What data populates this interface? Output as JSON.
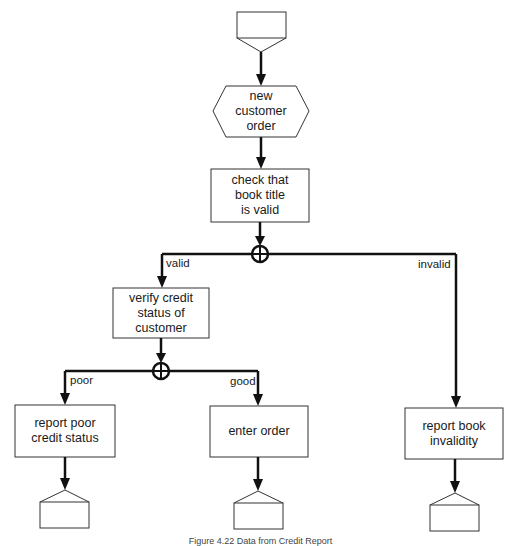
{
  "figure": {
    "type": "flowchart",
    "caption": "Figure 4.22  Data from Credit Report"
  },
  "nodes": {
    "start": {
      "shape": "start-terminal",
      "label": ""
    },
    "new_order": {
      "shape": "hexagon",
      "label": "new\ncustomer\norder"
    },
    "check_title": {
      "shape": "process",
      "label": "check that\nbook title\nis valid"
    },
    "junction1": {
      "shape": "xor-junction",
      "label": ""
    },
    "verify_credit": {
      "shape": "process",
      "label": "verify credit\nstatus of customer"
    },
    "junction2": {
      "shape": "xor-junction",
      "label": ""
    },
    "report_poor": {
      "shape": "process",
      "label": "report poor\ncredit status"
    },
    "enter_order": {
      "shape": "process",
      "label": "enter order"
    },
    "report_invalid": {
      "shape": "process",
      "label": "report book\ninvalidity"
    },
    "end_poor": {
      "shape": "end-terminal",
      "label": ""
    },
    "end_order": {
      "shape": "end-terminal",
      "label": ""
    },
    "end_invalid": {
      "shape": "end-terminal",
      "label": ""
    }
  },
  "edges": {
    "valid": "valid",
    "invalid": "invalid",
    "poor": "poor",
    "good": "good"
  },
  "colors": {
    "line": "#111111",
    "box_stroke": "#333333",
    "background": "#ffffff"
  }
}
